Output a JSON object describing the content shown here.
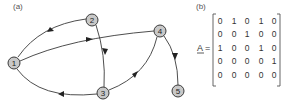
{
  "panels": {
    "a": {
      "label": "(a)"
    },
    "b": {
      "label": "(b)"
    }
  },
  "graph": {
    "nodes": [
      {
        "id": "1",
        "label": "1",
        "x": 14,
        "y": 63
      },
      {
        "id": "2",
        "label": "2",
        "x": 92,
        "y": 20
      },
      {
        "id": "3",
        "label": "3",
        "x": 103,
        "y": 93
      },
      {
        "id": "4",
        "label": "4",
        "x": 160,
        "y": 31
      },
      {
        "id": "5",
        "label": "5",
        "x": 178,
        "y": 91
      }
    ],
    "edges": [
      {
        "from": "1",
        "to": "2"
      },
      {
        "from": "1",
        "to": "4"
      },
      {
        "from": "2",
        "to": "3"
      },
      {
        "from": "3",
        "to": "1"
      },
      {
        "from": "3",
        "to": "4"
      },
      {
        "from": "4",
        "to": "5"
      }
    ],
    "node_fill": "#c8c8c8",
    "edge_color": "#3a3a3a"
  },
  "matrix": {
    "name": "A",
    "equals": "=",
    "rows": [
      [
        "0",
        "1",
        "0",
        "1",
        "0"
      ],
      [
        "0",
        "0",
        "1",
        "0",
        "0"
      ],
      [
        "1",
        "0",
        "0",
        "1",
        "0"
      ],
      [
        "0",
        "0",
        "0",
        "0",
        "1"
      ],
      [
        "0",
        "0",
        "0",
        "0",
        "0"
      ]
    ]
  }
}
